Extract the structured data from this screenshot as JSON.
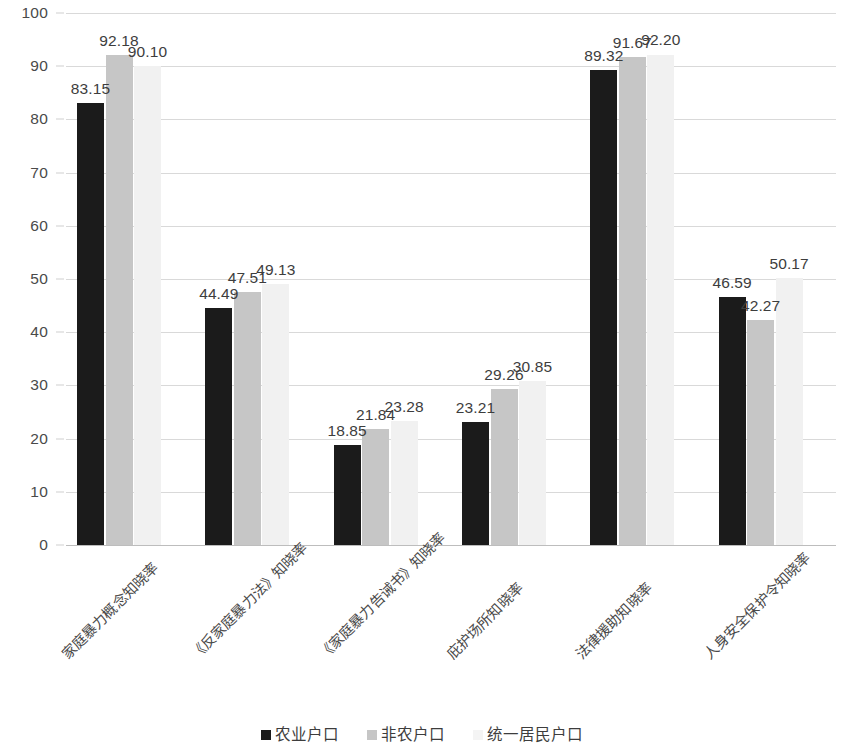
{
  "chart_data": {
    "type": "bar",
    "title": "",
    "subtitle": "",
    "xlabel": "",
    "ylabel": "",
    "ylim": [
      0,
      100
    ],
    "y_ticks": [
      0,
      10,
      20,
      30,
      40,
      50,
      60,
      70,
      80,
      90,
      100
    ],
    "grid": true,
    "legend_position": "bottom",
    "grouping": "grouped",
    "data_labels": true,
    "categories": [
      "家庭暴力概念知晓率",
      "《反家庭暴力法》知晓率",
      "《家庭暴力告诫书》知晓率",
      "庇护场所知晓率",
      "法律援助知晓率",
      "人身安全保护令知晓率"
    ],
    "series": [
      {
        "name": "农业户口",
        "color": "#1b1b1b",
        "values": [
          83.15,
          44.49,
          18.85,
          23.21,
          89.32,
          46.59
        ],
        "labels": [
          "83.15",
          "44.49",
          "18.85",
          "23.21",
          "89.32",
          "46.59"
        ]
      },
      {
        "name": "非农户口",
        "color": "#c6c6c6",
        "values": [
          92.18,
          47.51,
          21.84,
          29.26,
          91.67,
          42.27
        ],
        "labels": [
          "92.18",
          "47.51",
          "21.84",
          "29.26",
          "91.67",
          "42.27"
        ]
      },
      {
        "name": "统一居民户口",
        "color": "#f1f1f1",
        "values": [
          90.1,
          49.13,
          23.28,
          30.85,
          92.2,
          50.17
        ],
        "labels": [
          "90.10",
          "49.13",
          "23.28",
          "30.85",
          "92.20",
          "50.17"
        ]
      }
    ]
  },
  "axis": {
    "y_tick_labels": [
      "100",
      "90",
      "80",
      "70",
      "60",
      "50",
      "40",
      "30",
      "20",
      "10",
      "0"
    ]
  },
  "legend": {
    "items": [
      {
        "label": "农业户口",
        "color": "#1b1b1b"
      },
      {
        "label": "非农户口",
        "color": "#c6c6c6"
      },
      {
        "label": "统一居民户口",
        "color": "#f4f4f4"
      }
    ]
  },
  "colors": {
    "series_agricultural": "#1b1b1b",
    "series_nonagricultural": "#c6c6c6",
    "series_unified": "#f1f1f1",
    "gridline": "#d9d9d9",
    "text": "#3d3d3d",
    "background": "#ffffff"
  }
}
